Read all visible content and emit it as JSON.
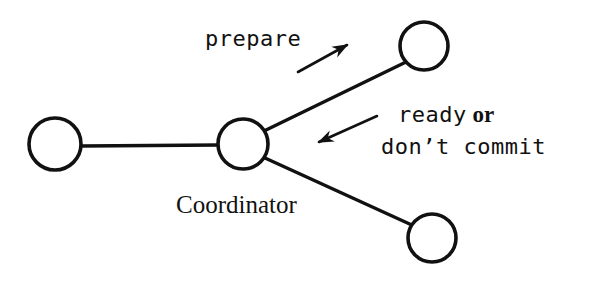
{
  "diagram": {
    "background_color": "#ffffff",
    "stroke_color": "#111111",
    "nodes": [
      {
        "id": "participant-left",
        "cx": 55,
        "cy": 144,
        "r": 26
      },
      {
        "id": "coordinator",
        "cx": 243,
        "cy": 144,
        "r": 25
      },
      {
        "id": "participant-top",
        "cx": 424,
        "cy": 46,
        "r": 24
      },
      {
        "id": "participant-bottom",
        "cx": 432,
        "cy": 238,
        "r": 24
      }
    ],
    "edges": [
      {
        "id": "edge-left-coordinator",
        "x1": 81,
        "y1": 146,
        "x2": 219,
        "y2": 145
      },
      {
        "id": "edge-coordinator-top",
        "x1": 264,
        "y1": 131,
        "x2": 406,
        "y2": 62
      },
      {
        "id": "edge-coordinator-bottom",
        "x1": 265,
        "y1": 158,
        "x2": 414,
        "y2": 226
      }
    ],
    "arrows": [
      {
        "id": "arrow-prepare",
        "x1": 298,
        "y1": 72,
        "x2": 350,
        "y2": 43
      },
      {
        "id": "arrow-response",
        "x1": 377,
        "y1": 116,
        "x2": 315,
        "y2": 144
      }
    ],
    "labels": {
      "prepare": "prepare",
      "ready": "ready",
      "or": "or",
      "dont_commit": "don’t commit",
      "coordinator": "Coordinator"
    }
  }
}
